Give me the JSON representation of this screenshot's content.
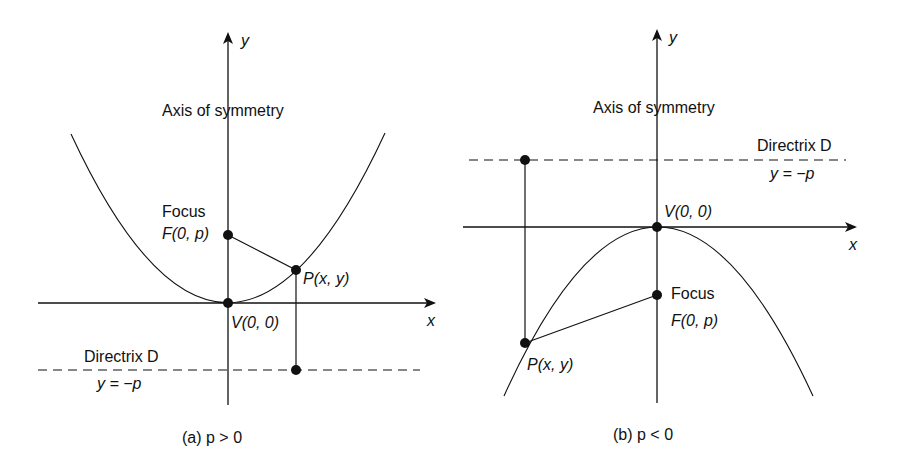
{
  "figure_a": {
    "caption": "(a)  p > 0",
    "axis_x_label": "x",
    "axis_y_label": "y",
    "axis_of_symmetry": "Axis of symmetry",
    "focus_title": "Focus",
    "focus_point": "F(0, p)",
    "point_label": "P(x, y)",
    "vertex_label": "V(0, 0)",
    "directrix_title": "Directrix D",
    "directrix_eq": "y = −p",
    "opens": "up"
  },
  "figure_b": {
    "caption": "(b)  p < 0",
    "axis_x_label": "x",
    "axis_y_label": "y",
    "axis_of_symmetry": "Axis of symmetry",
    "focus_title": "Focus",
    "focus_point": "F(0, p)",
    "point_label": "P(x, y)",
    "vertex_label": "V(0, 0)",
    "directrix_title": "Directrix D",
    "directrix_eq": "y = −p",
    "opens": "down"
  },
  "colors": {
    "ink": "#111111",
    "background": "#ffffff"
  }
}
